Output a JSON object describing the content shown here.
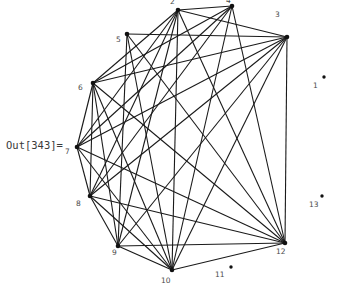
{
  "output_label": {
    "text": "Out[343]="
  },
  "colors": {
    "background": "#ffffff",
    "edge": "#1a1a1a",
    "vertex": "#111111",
    "label_text": "#4a4a4a",
    "output_text": "#3a3a3a"
  },
  "chart_data": {
    "type": "diagram",
    "subtype": "graph-network",
    "title": "",
    "layout": "circular",
    "vertex_count": 13,
    "vertices": [
      {
        "id": "1",
        "label": "1",
        "x": 324,
        "y": 77,
        "label_x": 313,
        "label_y": 88,
        "isolated": true
      },
      {
        "id": "2",
        "label": "2",
        "x": 178,
        "y": 10,
        "label_x": 170,
        "label_y": 4,
        "isolated": false
      },
      {
        "id": "3",
        "label": "3",
        "x": 287,
        "y": 37,
        "label_x": 275,
        "label_y": 17,
        "isolated": false
      },
      {
        "id": "4",
        "label": "4",
        "x": 232,
        "y": 6,
        "label_x": 226,
        "label_y": 3,
        "isolated": false
      },
      {
        "id": "5",
        "label": "5",
        "x": 127,
        "y": 34,
        "label_x": 116,
        "label_y": 42,
        "isolated": false
      },
      {
        "id": "6",
        "label": "6",
        "x": 93,
        "y": 83,
        "label_x": 78,
        "label_y": 90,
        "isolated": false
      },
      {
        "id": "7",
        "label": "7",
        "x": 77,
        "y": 147,
        "label_x": 65,
        "label_y": 154,
        "isolated": false
      },
      {
        "id": "8",
        "label": "8",
        "x": 90,
        "y": 196,
        "label_x": 76,
        "label_y": 206,
        "isolated": false
      },
      {
        "id": "9",
        "label": "9",
        "x": 118,
        "y": 246,
        "label_x": 112,
        "label_y": 255,
        "isolated": false
      },
      {
        "id": "10",
        "label": "10",
        "x": 172,
        "y": 270,
        "label_x": 161,
        "label_y": 283,
        "isolated": false
      },
      {
        "id": "11",
        "label": "11",
        "x": 231,
        "y": 267,
        "label_x": 215,
        "label_y": 277,
        "isolated": true
      },
      {
        "id": "12",
        "label": "12",
        "x": 285,
        "y": 243,
        "label_x": 276,
        "label_y": 254,
        "isolated": false
      },
      {
        "id": "13",
        "label": "13",
        "x": 322,
        "y": 196,
        "label_x": 309,
        "label_y": 207,
        "isolated": true
      }
    ],
    "edges": [
      [
        "2",
        "3"
      ],
      [
        "2",
        "4"
      ],
      [
        "2",
        "6"
      ],
      [
        "2",
        "7"
      ],
      [
        "2",
        "8"
      ],
      [
        "2",
        "9"
      ],
      [
        "2",
        "10"
      ],
      [
        "2",
        "12"
      ],
      [
        "3",
        "5"
      ],
      [
        "3",
        "6"
      ],
      [
        "3",
        "8"
      ],
      [
        "3",
        "9"
      ],
      [
        "3",
        "10"
      ],
      [
        "3",
        "12"
      ],
      [
        "3",
        "7"
      ],
      [
        "4",
        "6"
      ],
      [
        "4",
        "8"
      ],
      [
        "4",
        "10"
      ],
      [
        "4",
        "12"
      ],
      [
        "4",
        "7"
      ],
      [
        "5",
        "10"
      ],
      [
        "5",
        "12"
      ],
      [
        "5",
        "9"
      ],
      [
        "6",
        "7"
      ],
      [
        "6",
        "8"
      ],
      [
        "6",
        "9"
      ],
      [
        "6",
        "10"
      ],
      [
        "6",
        "12"
      ],
      [
        "7",
        "8"
      ],
      [
        "7",
        "10"
      ],
      [
        "7",
        "12"
      ],
      [
        "8",
        "9"
      ],
      [
        "8",
        "10"
      ],
      [
        "8",
        "12"
      ],
      [
        "9",
        "10"
      ],
      [
        "9",
        "12"
      ],
      [
        "10",
        "12"
      ]
    ],
    "edge_count": 37,
    "isolated_vertices": [
      "1",
      "11",
      "13"
    ],
    "grid": false,
    "legend": false,
    "xlabel": "",
    "ylabel": ""
  }
}
